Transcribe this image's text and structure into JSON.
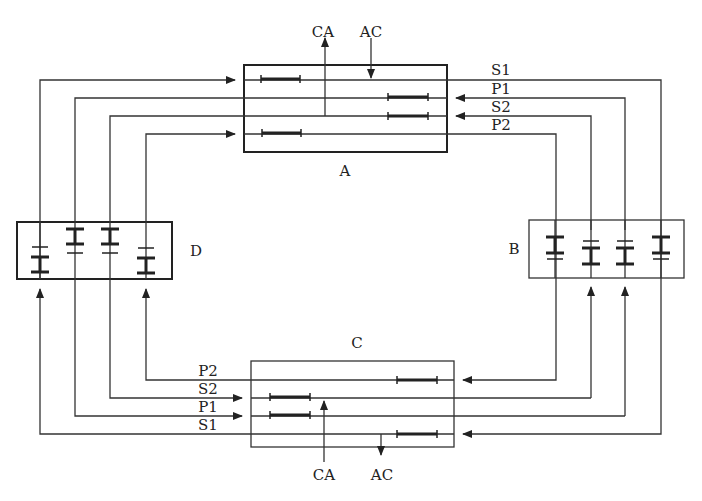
{
  "diagram": {
    "type": "interlocked bus / transmission circuit diagram",
    "nodes": {
      "A": {
        "label": "A",
        "x": 244,
        "y": 65,
        "w": 203,
        "h": 87
      },
      "B": {
        "label": "B",
        "x": 529,
        "y": 220,
        "w": 155,
        "h": 58
      },
      "C": {
        "label": "C",
        "x": 251,
        "y": 361,
        "w": 203,
        "h": 86
      },
      "D": {
        "label": "D",
        "x": 17,
        "y": 222,
        "w": 155,
        "h": 57
      }
    },
    "signals": {
      "S1": "S1",
      "P1": "P1",
      "S2": "S2",
      "P2": "P2",
      "CA": "CA",
      "AC": "AC"
    },
    "top_labels": {
      "ca": "CA",
      "ac": "AC"
    },
    "bottom_labels": {
      "ca": "CA",
      "ac": "AC"
    },
    "right_labels": [
      "S1",
      "P1",
      "S2",
      "P2"
    ],
    "left_bottom_labels": [
      "P2",
      "S2",
      "P1",
      "S1"
    ],
    "stroke_color": "#333333",
    "background": "#ffffff"
  }
}
